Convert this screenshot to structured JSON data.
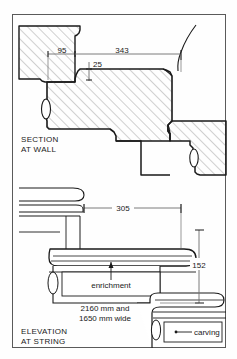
{
  "drawing": {
    "type": "architectural-detail",
    "sheet_background": "#fefefe",
    "line_color": "#1a1a1a",
    "hatch_color": "#8a8a8a",
    "frame": {
      "x": 12,
      "y": 14,
      "width": 214,
      "height": 334
    },
    "views": [
      {
        "id": "section-at-wall",
        "title_line_1": "SECTION",
        "title_line_2": "AT WALL",
        "dimensions": [
          {
            "label": "95",
            "orientation": "horizontal"
          },
          {
            "label": "343",
            "orientation": "horizontal"
          },
          {
            "label": "25",
            "orientation": "vertical"
          }
        ]
      },
      {
        "id": "elevation-at-string",
        "title_line_1": "ELEVATION",
        "title_line_2": "AT STRING",
        "dimensions": [
          {
            "label": "305",
            "orientation": "horizontal"
          },
          {
            "label": "152",
            "orientation": "vertical"
          }
        ],
        "annotations": [
          {
            "label": "enrichment",
            "leader": "up"
          },
          {
            "label": "carving",
            "leader": "left"
          }
        ],
        "notes": [
          "2160 mm and",
          "1650 mm wide"
        ]
      }
    ]
  }
}
